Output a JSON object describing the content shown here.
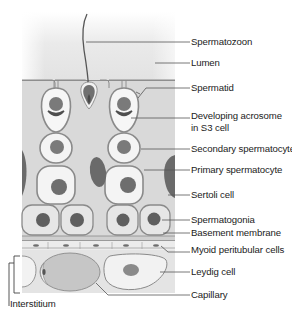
{
  "figure": {
    "colors": {
      "lumen_top": "#ffffff",
      "lumen": "#e4e4e4",
      "sertoli": "#d6d6d6",
      "cell_fill": "#f4f4f4",
      "cell_outline": "#8a8a8a",
      "nucleus": "#6e6e6e",
      "interstitium": "#e0e0e0",
      "capillary": "#c4c4c4",
      "leader": "#555555",
      "text": "#222222"
    }
  },
  "labels": [
    {
      "id": "spermatozoon",
      "text": "Spermatozoon"
    },
    {
      "id": "lumen",
      "text": "Lumen"
    },
    {
      "id": "spermatid",
      "text": "Spermatid"
    },
    {
      "id": "developing-acrosome",
      "text": "Developing acrosome"
    },
    {
      "id": "developing-acrosome-2",
      "text": "in S3 cell"
    },
    {
      "id": "secondary-spermatocyte",
      "text": "Secondary spermatocyte"
    },
    {
      "id": "primary-spermatocyte",
      "text": "Primary spermatocyte"
    },
    {
      "id": "sertoli-cell",
      "text": "Sertoli cell"
    },
    {
      "id": "spermatogonia",
      "text": "Spermatogonia"
    },
    {
      "id": "basement-membrane",
      "text": "Basement membrane"
    },
    {
      "id": "myoid-peritubular-cells",
      "text": "Myoid peritubular cells"
    },
    {
      "id": "leydig-cell",
      "text": "Leydig cell"
    },
    {
      "id": "capillary",
      "text": "Capillary"
    },
    {
      "id": "interstitium",
      "text": "Interstitium"
    }
  ]
}
